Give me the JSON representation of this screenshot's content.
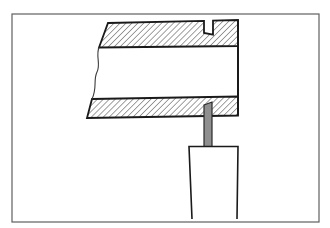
{
  "figure": {
    "kind": "technical-line-drawing",
    "description_label": "",
    "canvas": {
      "width": 330,
      "height": 228,
      "background": "#ffffff"
    },
    "frame": {
      "x": 12,
      "y": 14,
      "width": 307,
      "height": 208,
      "stroke": "#5f5f5f",
      "stroke_width": 1.2,
      "fill": "#ffffff"
    },
    "colors": {
      "outline": "#1a1a1a",
      "hatch_line": "#1f1f1f",
      "blade_fill": "#8f8f8f",
      "blade_stroke": "#2b2b2b",
      "shank_fill": "#ffffff",
      "break_line": "#3a3a3a"
    },
    "hatch": {
      "spacing": 4.2,
      "angle": 45,
      "line_width": 0.85
    },
    "stroke_widths": {
      "tube_outline": 1.8,
      "right_face": 2.0,
      "break_line": 1.1,
      "blade": 1.2,
      "shank": 1.6
    },
    "shapes": {
      "top_wall_points": "108,23 204,20.9 204,33 213,34.6 213,20.7 238,20 238,46 99,47.5",
      "bottom_wall_points": "92,99 238,96.5 238,115.5 87,118",
      "right_face": {
        "x1": 238,
        "y1": 20,
        "x2": 238,
        "y2": 115.5
      },
      "break_line_d": "M99,47.5 C95.5,56 101,64 97,72 C93,80 97.5,88 92,99",
      "blade_points": "204,105 212,102 212,146.5 204,146.5",
      "shank_fill_points": "189,146.5 238,146.5 237,219 192,219",
      "shank_outline_points": "192,219 189,146.5 238,146.5 237,219"
    }
  }
}
